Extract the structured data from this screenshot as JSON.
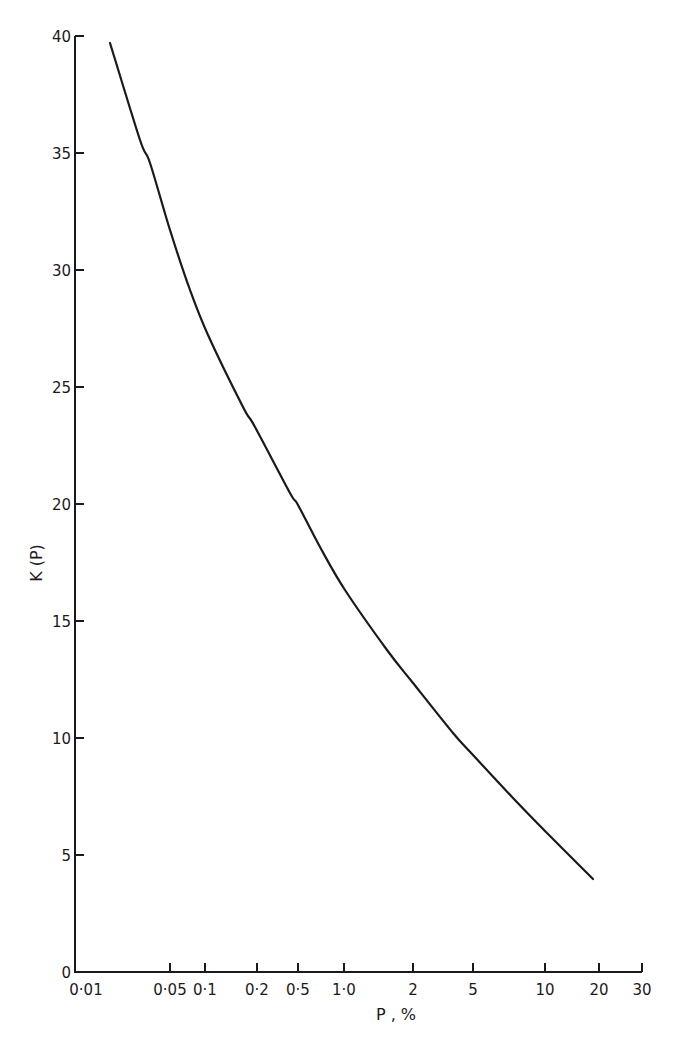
{
  "chart_data": {
    "type": "line",
    "title": "",
    "xlabel": "P , %",
    "ylabel": "K (P)",
    "x_scale": "probability",
    "x_ticks": [
      {
        "label": "0·01",
        "value": 0.01
      },
      {
        "label": "0·05",
        "value": 0.05
      },
      {
        "label": "0·1",
        "value": 0.1
      },
      {
        "label": "0·2",
        "value": 0.2
      },
      {
        "label": "0·5",
        "value": 0.5
      },
      {
        "label": "1·0",
        "value": 1.0
      },
      {
        "label": "2",
        "value": 2
      },
      {
        "label": "5",
        "value": 5
      },
      {
        "label": "10",
        "value": 10
      },
      {
        "label": "20",
        "value": 20
      },
      {
        "label": "30",
        "value": 30
      }
    ],
    "y_ticks": [
      0,
      5,
      10,
      15,
      20,
      25,
      30,
      35,
      40
    ],
    "ylim": [
      0,
      40
    ],
    "xlim": [
      0.01,
      30
    ],
    "grid": false,
    "legend": null,
    "series": [
      {
        "name": "K(P)",
        "x": [
          0.018,
          0.05,
          0.1,
          0.2,
          0.5,
          1.0,
          2,
          5,
          10,
          19
        ],
        "values": [
          39.7,
          31.7,
          27.2,
          23.3,
          20.0,
          16.4,
          12.3,
          9.3,
          6.0,
          4.0
        ]
      }
    ]
  },
  "layout": {
    "y_axis_x": 75,
    "x_axis_y": 972,
    "x_tick_px": [
      72,
      170,
      205,
      257,
      298,
      344,
      413,
      473,
      545,
      599,
      642
    ],
    "y_px_per_unit": 23.4,
    "curve_px": [
      [
        110,
        43
      ],
      [
        140,
        140
      ],
      [
        150,
        163
      ],
      [
        170,
        230
      ],
      [
        190,
        290
      ],
      [
        208,
        335
      ],
      [
        243,
        407
      ],
      [
        255,
        427
      ],
      [
        290,
        493
      ],
      [
        298,
        505
      ],
      [
        320,
        547
      ],
      [
        345,
        590
      ],
      [
        387,
        650
      ],
      [
        413,
        683
      ],
      [
        453,
        733
      ],
      [
        473,
        755
      ],
      [
        513,
        798
      ],
      [
        545,
        831
      ],
      [
        593,
        879
      ]
    ]
  }
}
